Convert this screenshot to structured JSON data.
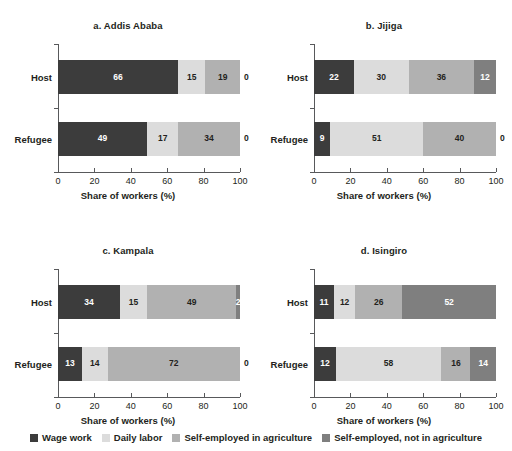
{
  "chart_data": {
    "type": "bar",
    "subtype": "100% stacked horizontal bar",
    "title": "",
    "xlabel": "Share of workers (%)",
    "ylabel": "",
    "xlim": [
      0,
      100
    ],
    "xticks": [
      "0",
      "20",
      "40",
      "60",
      "80",
      "100"
    ],
    "grid": false,
    "legend_position": "bottom",
    "categories": [
      "Host",
      "Refugee"
    ],
    "series": [
      {
        "name": "Wage work",
        "color": "#3c3c3c"
      },
      {
        "name": "Daily labor",
        "color": "#dcdcdc"
      },
      {
        "name": "Self-employed in agriculture",
        "color": "#b1b1b1"
      },
      {
        "name": "Self-employed, not in agriculture",
        "color": "#7f7f7f"
      }
    ],
    "panels": [
      {
        "title": "a. Addis Ababa",
        "rows": [
          {
            "label": "Host",
            "values": [
              66,
              15,
              19,
              0
            ]
          },
          {
            "label": "Refugee",
            "values": [
              49,
              17,
              34,
              0
            ]
          }
        ]
      },
      {
        "title": "b. Jijiga",
        "rows": [
          {
            "label": "Host",
            "values": [
              22,
              30,
              36,
              12
            ]
          },
          {
            "label": "Refugee",
            "values": [
              9,
              51,
              40,
              0
            ]
          }
        ]
      },
      {
        "title": "c. Kampala",
        "rows": [
          {
            "label": "Host",
            "values": [
              34,
              15,
              49,
              2
            ]
          },
          {
            "label": "Refugee",
            "values": [
              13,
              14,
              72,
              0
            ]
          }
        ]
      },
      {
        "title": "d. Isingiro",
        "rows": [
          {
            "label": "Host",
            "values": [
              11,
              12,
              26,
              52
            ]
          },
          {
            "label": "Refugee",
            "values": [
              12,
              58,
              16,
              14
            ]
          }
        ]
      }
    ]
  },
  "panel_a": {
    "title": "a. Addis Ababa",
    "xlabel": "Share of workers (%)"
  },
  "panel_b": {
    "title": "b. Jijiga",
    "xlabel": "Share of workers (%)"
  },
  "panel_c": {
    "title": "c. Kampala",
    "xlabel": "Share of workers (%)"
  },
  "panel_d": {
    "title": "d. Isingiro",
    "xlabel": "Share of workers (%)"
  },
  "legend": {
    "items": [
      {
        "label": "Wage work",
        "color": "#3c3c3c"
      },
      {
        "label": "Daily labor",
        "color": "#dcdcdc"
      },
      {
        "label": "Self-employed in agriculture",
        "color": "#b1b1b1"
      },
      {
        "label": "Self-employed, not in agriculture",
        "color": "#7f7f7f"
      }
    ]
  }
}
